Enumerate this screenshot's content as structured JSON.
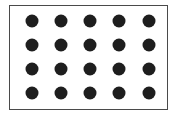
{
  "diagram": {
    "type": "dot-grid",
    "rows": 4,
    "columns": 5,
    "total_dots": 20,
    "dot_color": "#1e1e1e",
    "border_color": "#4a4a4a",
    "background_color": "#ffffff",
    "column_centers": [
      32,
      61,
      90,
      119,
      149
    ],
    "row_centers": [
      21,
      45,
      69,
      93
    ]
  }
}
